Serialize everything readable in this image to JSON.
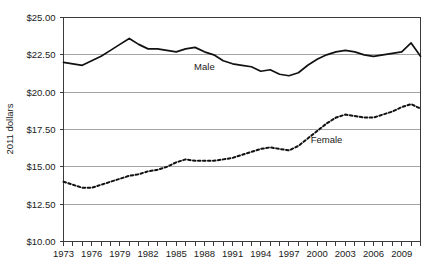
{
  "chart_data": {
    "type": "line",
    "title": "",
    "xlabel": "",
    "ylabel": "2011 dollars",
    "ylim": [
      10.0,
      25.0
    ],
    "xlim": [
      1973,
      2011
    ],
    "grid": true,
    "legend_position": "inline-annotation",
    "y_ticks": [
      10.0,
      12.5,
      15.0,
      17.5,
      20.0,
      22.5,
      25.0
    ],
    "y_tick_labels": [
      "$10.00",
      "$12.50",
      "$15.00",
      "$17.50",
      "$20.00",
      "$22.50",
      "$25.00"
    ],
    "x_ticks": [
      1973,
      1976,
      1979,
      1982,
      1985,
      1988,
      1991,
      1994,
      1997,
      2000,
      2003,
      2006,
      2009
    ],
    "x_tick_labels": [
      "1973",
      "1976",
      "1979",
      "1982",
      "1985",
      "1988",
      "1991",
      "1994",
      "1997",
      "2000",
      "2003",
      "2006",
      "2009"
    ],
    "x_minor_ticks": [
      1973,
      1974,
      1975,
      1976,
      1977,
      1978,
      1979,
      1980,
      1981,
      1982,
      1983,
      1984,
      1985,
      1986,
      1987,
      1988,
      1989,
      1990,
      1991,
      1992,
      1993,
      1994,
      1995,
      1996,
      1997,
      1998,
      1999,
      2000,
      2001,
      2002,
      2003,
      2004,
      2005,
      2006,
      2007,
      2008,
      2009,
      2010,
      2011
    ],
    "x": [
      1973,
      1974,
      1975,
      1976,
      1977,
      1978,
      1979,
      1980,
      1981,
      1982,
      1983,
      1984,
      1985,
      1986,
      1987,
      1988,
      1989,
      1990,
      1991,
      1992,
      1993,
      1994,
      1995,
      1996,
      1997,
      1998,
      1999,
      2000,
      2001,
      2002,
      2003,
      2004,
      2005,
      2006,
      2007,
      2008,
      2009,
      2010,
      2011
    ],
    "series": [
      {
        "name": "Male",
        "style": "solid",
        "label": "Male",
        "label_x": 1988,
        "label_y": 21.5,
        "values": [
          22.0,
          21.9,
          21.8,
          22.1,
          22.4,
          22.8,
          23.2,
          23.6,
          23.2,
          22.9,
          22.9,
          22.8,
          22.7,
          22.9,
          23.0,
          22.7,
          22.5,
          22.1,
          21.9,
          21.8,
          21.7,
          21.4,
          21.5,
          21.2,
          21.1,
          21.3,
          21.8,
          22.2,
          22.5,
          22.7,
          22.8,
          22.7,
          22.5,
          22.4,
          22.5,
          22.6,
          22.7,
          23.3,
          22.4
        ]
      },
      {
        "name": "Female",
        "style": "dashed",
        "label": "Female",
        "label_x": 2001,
        "label_y": 16.6,
        "values": [
          14.0,
          13.8,
          13.6,
          13.6,
          13.8,
          14.0,
          14.2,
          14.4,
          14.5,
          14.7,
          14.8,
          15.0,
          15.3,
          15.5,
          15.4,
          15.4,
          15.4,
          15.5,
          15.6,
          15.8,
          16.0,
          16.2,
          16.3,
          16.2,
          16.1,
          16.4,
          16.9,
          17.4,
          17.9,
          18.3,
          18.5,
          18.4,
          18.3,
          18.3,
          18.5,
          18.7,
          19.0,
          19.2,
          18.9
        ]
      }
    ]
  }
}
